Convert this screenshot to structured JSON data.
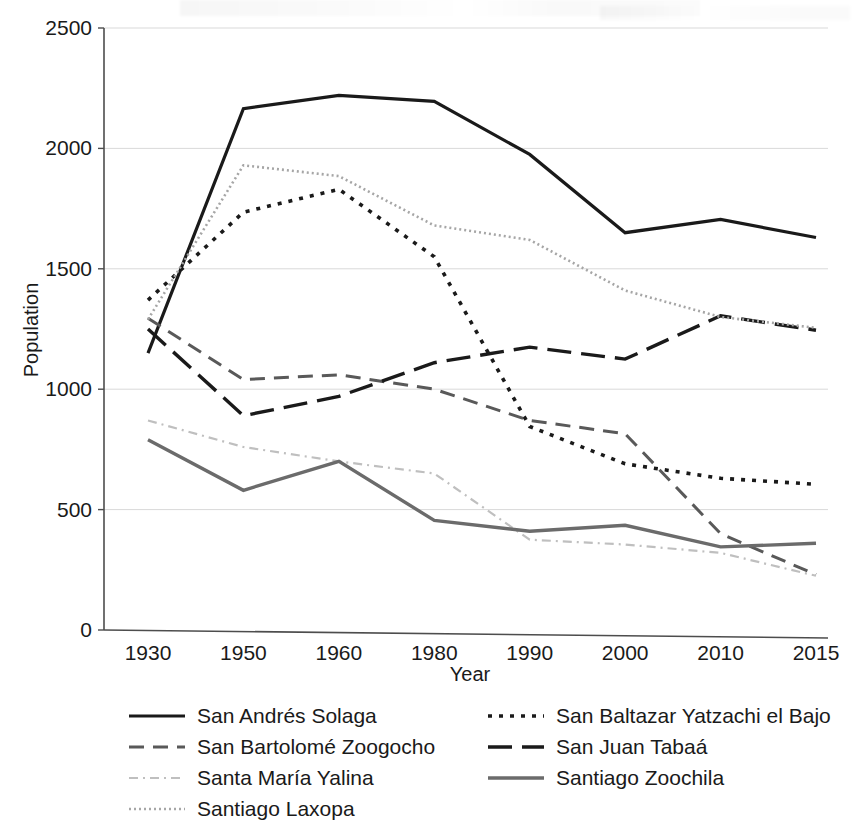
{
  "chart_data": {
    "type": "line",
    "title": "",
    "xlabel": "Year",
    "ylabel": "Population",
    "categories": [
      "1930",
      "1950",
      "1960",
      "1980",
      "1990",
      "2000",
      "2010",
      "2015"
    ],
    "ylim": [
      0,
      2500
    ],
    "yticks": [
      0,
      500,
      1000,
      1500,
      2000,
      2500
    ],
    "ytick_labels": [
      "0",
      "500",
      "1000",
      "1500",
      "2000",
      "2500"
    ],
    "grid": true,
    "legend_position": "bottom",
    "series": [
      {
        "name": "San Andrés Solaga",
        "style": "solid",
        "color": "#1a1a1a",
        "values": [
          1150,
          2165,
          2220,
          2195,
          1975,
          1650,
          1705,
          1630
        ]
      },
      {
        "name": "San Baltazar Yatzachi el Bajo",
        "style": "dotted",
        "color": "#1a1a1a",
        "values": [
          1370,
          1735,
          1830,
          1550,
          845,
          690,
          630,
          605
        ]
      },
      {
        "name": "San Bartolomé Zoogocho",
        "style": "dashed",
        "color": "#595959",
        "values": [
          1295,
          1040,
          1060,
          1000,
          870,
          815,
          400,
          230
        ]
      },
      {
        "name": "San Juan Tabaá",
        "style": "long-dash",
        "color": "#1a1a1a",
        "values": [
          1250,
          890,
          970,
          1110,
          1175,
          1125,
          1305,
          1245
        ]
      },
      {
        "name": "Santa María Yalina",
        "style": "dash-dot",
        "color": "#bfbfbf",
        "values": [
          870,
          760,
          700,
          650,
          375,
          355,
          320,
          225
        ]
      },
      {
        "name": "Santiago Zoochila",
        "style": "solid-gray",
        "color": "#6b6b6b",
        "values": [
          790,
          580,
          700,
          455,
          410,
          435,
          345,
          360
        ]
      },
      {
        "name": "Santiago Laxopa",
        "style": "fine-dotted",
        "color": "#a6a6a6",
        "values": [
          1290,
          1930,
          1885,
          1680,
          1620,
          1410,
          1300,
          1255
        ]
      }
    ]
  },
  "legend": {
    "left_column": [
      {
        "label": "San Andrés Solaga",
        "icon": "line-solid-icon"
      },
      {
        "label": "San Bartolomé Zoogocho",
        "icon": "line-dashed-icon"
      },
      {
        "label": "Santa María Yalina",
        "icon": "line-dash-dot-icon"
      },
      {
        "label": "Santiago Laxopa",
        "icon": "line-fine-dotted-icon"
      }
    ],
    "right_column": [
      {
        "label": "San Baltazar Yatzachi el Bajo",
        "icon": "line-dotted-icon"
      },
      {
        "label": "San Juan Tabaá",
        "icon": "line-long-dash-icon"
      },
      {
        "label": "Santiago Zoochila",
        "icon": "line-solid-gray-icon"
      }
    ]
  }
}
